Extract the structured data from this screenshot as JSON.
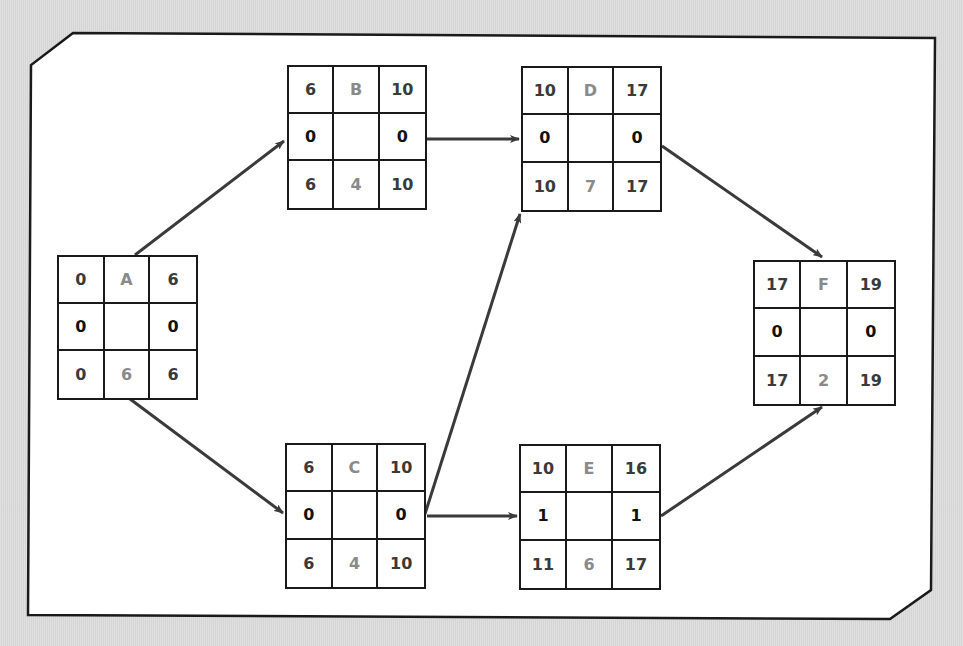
{
  "diagram": {
    "type": "activity-on-node network (critical path method)",
    "colors": {
      "background": "#dcdcdc",
      "panel": "#ffffff",
      "border": "#1a1a1a",
      "arrow": "#3a3a3a",
      "corner_text": "#3a3a3a",
      "slack_text": "#111111",
      "label_text": "#8a8a8a"
    },
    "nodes": [
      {
        "id": "A",
        "es": "0",
        "ef": "6",
        "slack_left": "0",
        "slack_right": "0",
        "ls": "0",
        "duration": "6",
        "lf": "6",
        "box": [
          57,
          255,
          141,
          145
        ]
      },
      {
        "id": "B",
        "es": "6",
        "ef": "10",
        "slack_left": "0",
        "slack_right": "0",
        "ls": "6",
        "duration": "4",
        "lf": "10",
        "box": [
          287,
          65,
          140,
          145
        ]
      },
      {
        "id": "C",
        "es": "6",
        "ef": "10",
        "slack_left": "0",
        "slack_right": "0",
        "ls": "6",
        "duration": "4",
        "lf": "10",
        "box": [
          285,
          443,
          141,
          146
        ]
      },
      {
        "id": "D",
        "es": "10",
        "ef": "17",
        "slack_left": "0",
        "slack_right": "0",
        "ls": "10",
        "duration": "7",
        "lf": "17",
        "box": [
          521,
          66,
          141,
          146
        ]
      },
      {
        "id": "E",
        "es": "10",
        "ef": "16",
        "slack_left": "1",
        "slack_right": "1",
        "ls": "11",
        "duration": "6",
        "lf": "17",
        "box": [
          519,
          444,
          142,
          146
        ]
      },
      {
        "id": "F",
        "es": "17",
        "ef": "19",
        "slack_left": "0",
        "slack_right": "0",
        "ls": "17",
        "duration": "2",
        "lf": "19",
        "box": [
          753,
          260,
          143,
          146
        ]
      }
    ],
    "edges": [
      {
        "from": "A",
        "to": "B",
        "x1": 135,
        "y1": 255,
        "x2": 284,
        "y2": 141
      },
      {
        "from": "A",
        "to": "C",
        "x1": 122,
        "y1": 393,
        "x2": 283,
        "y2": 513
      },
      {
        "from": "B",
        "to": "D",
        "x1": 427,
        "y1": 139,
        "x2": 519,
        "y2": 139
      },
      {
        "from": "C",
        "to": "D",
        "x1": 425,
        "y1": 514,
        "x2": 520,
        "y2": 214
      },
      {
        "from": "C",
        "to": "E",
        "x1": 427,
        "y1": 516,
        "x2": 517,
        "y2": 516
      },
      {
        "from": "D",
        "to": "F",
        "x1": 662,
        "y1": 146,
        "x2": 822,
        "y2": 257
      },
      {
        "from": "E",
        "to": "F",
        "x1": 661,
        "y1": 516,
        "x2": 822,
        "y2": 407
      }
    ]
  }
}
